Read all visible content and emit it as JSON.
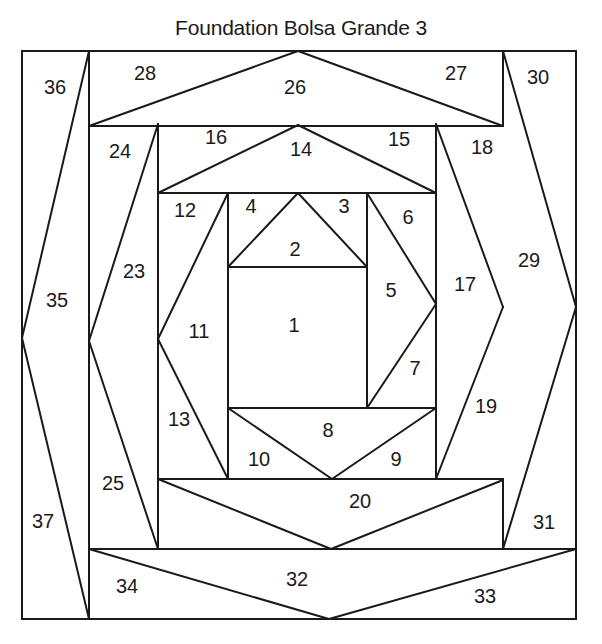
{
  "title": "Foundation Bolsa Grande 3",
  "frame": {
    "x": 22,
    "y": 51,
    "width": 554,
    "height": 568
  },
  "colors": {
    "line": "#1a1a1a",
    "background": "#ffffff"
  },
  "segments": [
    [
      89,
      51,
      89,
      619
    ],
    [
      503,
      51,
      503,
      126
    ],
    [
      89,
      126,
      503,
      126
    ],
    [
      89,
      126,
      298,
      51
    ],
    [
      298,
      51,
      503,
      126
    ],
    [
      22,
      338,
      89,
      51
    ],
    [
      22,
      338,
      89,
      619
    ],
    [
      503,
      51,
      576,
      307
    ],
    [
      576,
      307,
      503,
      549
    ],
    [
      89,
      549,
      576,
      549
    ],
    [
      89,
      549,
      329,
      619
    ],
    [
      329,
      619,
      576,
      549
    ],
    [
      158,
      124,
      158,
      549
    ],
    [
      436,
      124,
      436,
      479
    ],
    [
      158,
      193,
      436,
      193
    ],
    [
      158,
      193,
      298,
      125
    ],
    [
      298,
      125,
      436,
      193
    ],
    [
      89,
      341,
      158,
      124
    ],
    [
      89,
      341,
      158,
      549
    ],
    [
      436,
      124,
      503,
      307
    ],
    [
      503,
      307,
      436,
      479
    ],
    [
      503,
      479,
      503,
      549
    ],
    [
      158,
      479,
      503,
      479
    ],
    [
      158,
      479,
      331,
      549
    ],
    [
      331,
      549,
      503,
      480
    ],
    [
      228,
      193,
      228,
      479
    ],
    [
      367,
      193,
      367,
      408
    ],
    [
      228,
      267,
      367,
      267
    ],
    [
      228,
      267,
      298,
      193
    ],
    [
      298,
      193,
      367,
      267
    ],
    [
      158,
      339,
      228,
      193
    ],
    [
      158,
      339,
      228,
      479
    ],
    [
      367,
      193,
      436,
      304
    ],
    [
      436,
      304,
      367,
      408
    ],
    [
      228,
      408,
      436,
      408
    ],
    [
      228,
      408,
      332,
      479
    ],
    [
      332,
      479,
      436,
      408
    ]
  ],
  "pieces": [
    {
      "n": "1",
      "x": 294,
      "y": 327
    },
    {
      "n": "2",
      "x": 295,
      "y": 251
    },
    {
      "n": "3",
      "x": 344,
      "y": 208
    },
    {
      "n": "4",
      "x": 251,
      "y": 208
    },
    {
      "n": "5",
      "x": 391,
      "y": 292
    },
    {
      "n": "6",
      "x": 408,
      "y": 219
    },
    {
      "n": "7",
      "x": 415,
      "y": 370
    },
    {
      "n": "8",
      "x": 328,
      "y": 432
    },
    {
      "n": "9",
      "x": 396,
      "y": 461
    },
    {
      "n": "10",
      "x": 259,
      "y": 461
    },
    {
      "n": "11",
      "x": 199,
      "y": 333
    },
    {
      "n": "12",
      "x": 185,
      "y": 212
    },
    {
      "n": "13",
      "x": 179,
      "y": 421
    },
    {
      "n": "14",
      "x": 301,
      "y": 151
    },
    {
      "n": "15",
      "x": 399,
      "y": 141
    },
    {
      "n": "16",
      "x": 216,
      "y": 139
    },
    {
      "n": "17",
      "x": 465,
      "y": 286
    },
    {
      "n": "18",
      "x": 482,
      "y": 149
    },
    {
      "n": "19",
      "x": 486,
      "y": 408
    },
    {
      "n": "20",
      "x": 360,
      "y": 503
    },
    {
      "n": "23",
      "x": 134,
      "y": 273
    },
    {
      "n": "24",
      "x": 120,
      "y": 153
    },
    {
      "n": "25",
      "x": 113,
      "y": 485
    },
    {
      "n": "26",
      "x": 295,
      "y": 89
    },
    {
      "n": "27",
      "x": 456,
      "y": 75
    },
    {
      "n": "28",
      "x": 145,
      "y": 75
    },
    {
      "n": "29",
      "x": 529,
      "y": 262
    },
    {
      "n": "30",
      "x": 538,
      "y": 79
    },
    {
      "n": "31",
      "x": 544,
      "y": 524
    },
    {
      "n": "32",
      "x": 297,
      "y": 581
    },
    {
      "n": "33",
      "x": 485,
      "y": 598
    },
    {
      "n": "34",
      "x": 127,
      "y": 588
    },
    {
      "n": "35",
      "x": 57,
      "y": 302
    },
    {
      "n": "36",
      "x": 55,
      "y": 89
    },
    {
      "n": "37",
      "x": 43,
      "y": 523
    }
  ]
}
